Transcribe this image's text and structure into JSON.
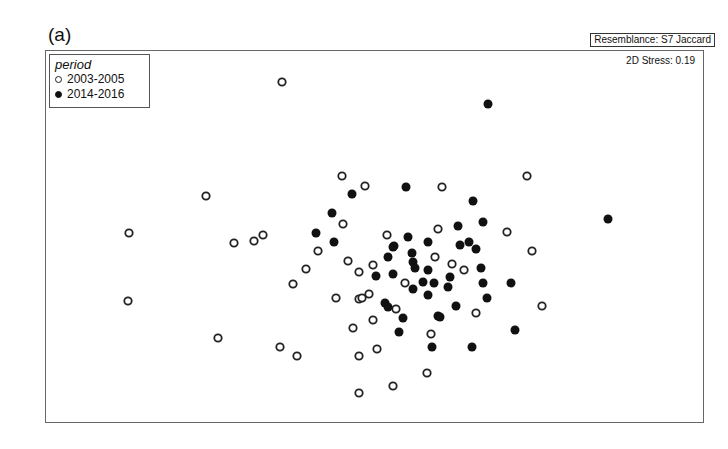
{
  "chart_data": {
    "type": "scatter",
    "title": "(a)",
    "subtitle": "Resemblance: S7 Jaccard",
    "annotation": "2D Stress: 0.19",
    "xlabel": "",
    "ylabel": "",
    "grid": false,
    "legend": {
      "title": "period",
      "position": "top-left",
      "entries": [
        {
          "label": "2003-2005",
          "marker": "open-circle"
        },
        {
          "label": "2014-2016",
          "marker": "filled-circle"
        }
      ]
    },
    "coordinate_note": "nMDS ordination, no axis ticks; coordinates are pixel positions in the 728x449 image",
    "series": [
      {
        "name": "2003-2005",
        "marker": "open-circle",
        "points": [
          [
            282,
            82
          ],
          [
            206,
            196
          ],
          [
            129,
            233
          ],
          [
            128,
            301
          ],
          [
            234,
            243
          ],
          [
            254,
            241
          ],
          [
            263,
            235
          ],
          [
            306,
            269
          ],
          [
            293,
            284
          ],
          [
            218,
            338
          ],
          [
            280,
            347
          ],
          [
            297,
            356
          ],
          [
            342,
            176
          ],
          [
            365,
            186
          ],
          [
            343,
            224
          ],
          [
            318,
            251
          ],
          [
            387,
            235
          ],
          [
            348,
            261
          ],
          [
            359,
            272
          ],
          [
            373,
            265
          ],
          [
            336,
            298
          ],
          [
            359,
            299
          ],
          [
            369,
            294
          ],
          [
            353,
            328
          ],
          [
            373,
            320
          ],
          [
            377,
            349
          ],
          [
            359,
            356
          ],
          [
            359,
            393
          ],
          [
            393,
            386
          ],
          [
            427,
            373
          ],
          [
            431,
            334
          ],
          [
            396,
            309
          ],
          [
            405,
            283
          ],
          [
            435,
            257
          ],
          [
            452,
            264
          ],
          [
            464,
            270
          ],
          [
            438,
            229
          ],
          [
            442,
            187
          ],
          [
            527,
            176
          ],
          [
            507,
            232
          ],
          [
            532,
            251
          ],
          [
            476,
            313
          ],
          [
            542,
            306
          ],
          [
            362,
            298
          ]
        ]
      },
      {
        "name": "2014-2016",
        "marker": "filled-circle",
        "points": [
          [
            488,
            104
          ],
          [
            608,
            219
          ],
          [
            406,
            187
          ],
          [
            352,
            194
          ],
          [
            332,
            213
          ],
          [
            316,
            233
          ],
          [
            334,
            242
          ],
          [
            473,
            201
          ],
          [
            458,
            226
          ],
          [
            483,
            222
          ],
          [
            408,
            237
          ],
          [
            428,
            242
          ],
          [
            393,
            247
          ],
          [
            394,
            246
          ],
          [
            412,
            253
          ],
          [
            388,
            257
          ],
          [
            413,
            262
          ],
          [
            415,
            268
          ],
          [
            428,
            270
          ],
          [
            393,
            274
          ],
          [
            376,
            276
          ],
          [
            460,
            245
          ],
          [
            469,
            242
          ],
          [
            476,
            249
          ],
          [
            481,
            268
          ],
          [
            450,
            277
          ],
          [
            448,
            287
          ],
          [
            483,
            283
          ],
          [
            511,
            283
          ],
          [
            487,
            298
          ],
          [
            456,
            306
          ],
          [
            413,
            289
          ],
          [
            423,
            282
          ],
          [
            434,
            283
          ],
          [
            428,
            295
          ],
          [
            385,
            303
          ],
          [
            388,
            307
          ],
          [
            403,
            318
          ],
          [
            438,
            316
          ],
          [
            399,
            332
          ],
          [
            432,
            347
          ],
          [
            472,
            347
          ],
          [
            515,
            330
          ],
          [
            440,
            317
          ]
        ]
      }
    ],
    "marker_style": {
      "radius": 4.5,
      "open_stroke": "#222222",
      "filled_color": "#111111"
    }
  },
  "labels": {
    "panel": "(a)",
    "resemblance": "Resemblance: S7 Jaccard",
    "stress": "2D Stress: 0.19",
    "legend_title": "period",
    "legend_open": "2003-2005",
    "legend_filled": "2014-2016"
  }
}
